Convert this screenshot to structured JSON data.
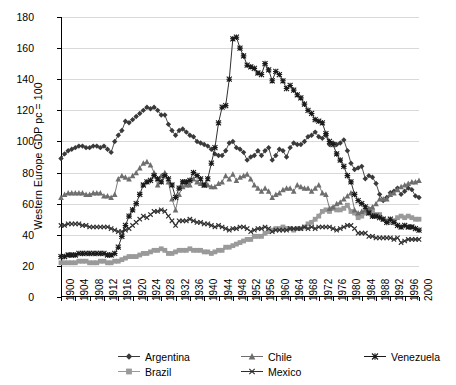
{
  "chart_data": {
    "type": "line",
    "title": "",
    "xlabel": "",
    "ylabel": "Western Europe GDP pc = 100",
    "xlim": [
      1900,
      2000
    ],
    "ylim": [
      0,
      180
    ],
    "yticks": [
      0,
      20,
      40,
      60,
      80,
      100,
      120,
      140,
      160,
      180
    ],
    "xticks": [
      1900,
      1904,
      1908,
      1912,
      1916,
      1920,
      1924,
      1928,
      1932,
      1936,
      1940,
      1944,
      1948,
      1952,
      1956,
      1960,
      1964,
      1968,
      1972,
      1976,
      1980,
      1984,
      1988,
      1992,
      1996,
      2000
    ],
    "grid": "horizontal",
    "legend_position": "bottom",
    "x": [
      1900,
      1901,
      1902,
      1903,
      1904,
      1905,
      1906,
      1907,
      1908,
      1909,
      1910,
      1911,
      1912,
      1913,
      1914,
      1915,
      1916,
      1917,
      1918,
      1919,
      1920,
      1921,
      1922,
      1923,
      1924,
      1925,
      1926,
      1927,
      1928,
      1929,
      1930,
      1931,
      1932,
      1933,
      1934,
      1935,
      1936,
      1937,
      1938,
      1939,
      1940,
      1941,
      1942,
      1943,
      1944,
      1945,
      1946,
      1947,
      1948,
      1949,
      1950,
      1951,
      1952,
      1953,
      1954,
      1955,
      1956,
      1957,
      1958,
      1959,
      1960,
      1961,
      1962,
      1963,
      1964,
      1965,
      1966,
      1967,
      1968,
      1969,
      1970,
      1971,
      1972,
      1973,
      1974,
      1975,
      1976,
      1977,
      1978,
      1979,
      1980,
      1981,
      1982,
      1983,
      1984,
      1985,
      1986,
      1987,
      1988,
      1989,
      1990,
      1991,
      1992,
      1993,
      1994,
      1995,
      1996,
      1997,
      1998,
      1999,
      2000
    ],
    "series": [
      {
        "name": "Argentina",
        "marker": "diamond",
        "color": "#3a3a3a",
        "values": [
          89,
          92,
          94,
          95,
          96,
          97,
          97,
          96,
          96,
          97,
          97,
          96,
          97,
          95,
          93,
          100,
          104,
          107,
          113,
          112,
          114,
          116,
          118,
          120,
          122,
          121,
          122,
          120,
          117,
          117,
          111,
          107,
          104,
          107,
          108,
          106,
          104,
          103,
          100,
          99,
          98,
          97,
          95,
          92,
          91,
          91,
          94,
          99,
          100,
          96,
          95,
          93,
          88,
          90,
          91,
          94,
          91,
          94,
          96,
          88,
          91,
          95,
          94,
          90,
          96,
          99,
          98,
          98,
          100,
          103,
          104,
          106,
          103,
          102,
          104,
          98,
          99,
          98,
          99,
          101,
          94,
          86,
          82,
          83,
          84,
          76,
          78,
          77,
          73,
          66,
          62,
          64,
          67,
          68,
          70,
          66,
          68,
          70,
          69,
          65,
          64
        ]
      },
      {
        "name": "Brazil",
        "marker": "square",
        "color": "#9a9a9a",
        "values": [
          22,
          22,
          22,
          22,
          22,
          23,
          23,
          23,
          22,
          22,
          22,
          23,
          23,
          22,
          22,
          23,
          23,
          24,
          25,
          26,
          26,
          26,
          27,
          28,
          28,
          29,
          30,
          30,
          31,
          30,
          28,
          28,
          29,
          30,
          30,
          30,
          31,
          30,
          30,
          30,
          29,
          29,
          28,
          29,
          30,
          30,
          32,
          32,
          33,
          34,
          35,
          36,
          37,
          37,
          39,
          39,
          39,
          41,
          42,
          43,
          44,
          44,
          45,
          44,
          44,
          43,
          44,
          44,
          45,
          47,
          48,
          50,
          52,
          55,
          56,
          55,
          57,
          56,
          56,
          57,
          59,
          55,
          54,
          51,
          52,
          54,
          56,
          55,
          53,
          53,
          50,
          49,
          48,
          49,
          51,
          52,
          51,
          52,
          51,
          50,
          50
        ]
      },
      {
        "name": "Chile",
        "marker": "triangle",
        "color": "#6e6e6e",
        "values": [
          64,
          66,
          67,
          67,
          67,
          67,
          67,
          66,
          66,
          67,
          67,
          67,
          65,
          65,
          64,
          66,
          76,
          78,
          77,
          76,
          78,
          80,
          83,
          86,
          87,
          85,
          80,
          72,
          78,
          80,
          74,
          63,
          56,
          66,
          71,
          72,
          72,
          76,
          74,
          73,
          72,
          72,
          71,
          71,
          73,
          74,
          78,
          76,
          79,
          75,
          77,
          78,
          79,
          76,
          72,
          70,
          68,
          70,
          68,
          64,
          66,
          67,
          69,
          70,
          70,
          68,
          72,
          71,
          70,
          70,
          68,
          70,
          72,
          67,
          66,
          57,
          58,
          60,
          61,
          63,
          65,
          67,
          56,
          54,
          55,
          56,
          57,
          58,
          60,
          63,
          63,
          63,
          66,
          67,
          69,
          71,
          72,
          73,
          74,
          74,
          75
        ]
      },
      {
        "name": "Mexico",
        "marker": "x",
        "color": "#2f2f2f",
        "values": [
          46,
          46,
          47,
          47,
          47,
          47,
          46,
          46,
          45,
          45,
          45,
          45,
          45,
          45,
          44,
          43,
          42,
          42,
          43,
          44,
          46,
          48,
          50,
          52,
          51,
          53,
          55,
          55,
          56,
          55,
          52,
          49,
          46,
          49,
          49,
          49,
          50,
          49,
          48,
          48,
          47,
          47,
          46,
          45,
          46,
          45,
          44,
          43,
          44,
          44,
          45,
          45,
          44,
          42,
          43,
          44,
          44,
          45,
          44,
          42,
          43,
          43,
          43,
          43,
          44,
          44,
          44,
          44,
          45,
          44,
          45,
          44,
          45,
          45,
          45,
          45,
          44,
          43,
          44,
          45,
          46,
          46,
          44,
          41,
          41,
          41,
          39,
          39,
          38,
          38,
          38,
          38,
          38,
          37,
          38,
          35,
          36,
          37,
          37,
          37,
          37
        ]
      },
      {
        "name": "Venezuela",
        "marker": "star",
        "color": "#1a1a1a",
        "values": [
          26,
          26,
          27,
          27,
          27,
          28,
          28,
          28,
          28,
          28,
          28,
          28,
          28,
          27,
          27,
          28,
          32,
          39,
          46,
          52,
          56,
          60,
          66,
          72,
          74,
          75,
          78,
          76,
          74,
          78,
          76,
          72,
          64,
          70,
          74,
          74,
          75,
          80,
          78,
          76,
          72,
          76,
          86,
          96,
          112,
          122,
          123,
          140,
          166,
          167,
          160,
          155,
          149,
          148,
          147,
          144,
          143,
          150,
          146,
          139,
          145,
          143,
          139,
          134,
          136,
          133,
          130,
          128,
          124,
          120,
          118,
          114,
          113,
          112,
          105,
          100,
          98,
          92,
          88,
          84,
          78,
          74,
          66,
          62,
          60,
          58,
          54,
          52,
          52,
          51,
          50,
          48,
          50,
          48,
          46,
          45,
          46,
          45,
          45,
          44,
          43
        ]
      }
    ]
  },
  "legend": {
    "rows": [
      [
        {
          "name": "Argentina",
          "marker": "diamond"
        },
        {
          "name": "Chile",
          "marker": "triangle"
        },
        {
          "name": "Venezuela",
          "marker": "star"
        }
      ],
      [
        {
          "name": "Brazil",
          "marker": "square"
        },
        {
          "name": "Mexico",
          "marker": "x"
        }
      ]
    ]
  }
}
